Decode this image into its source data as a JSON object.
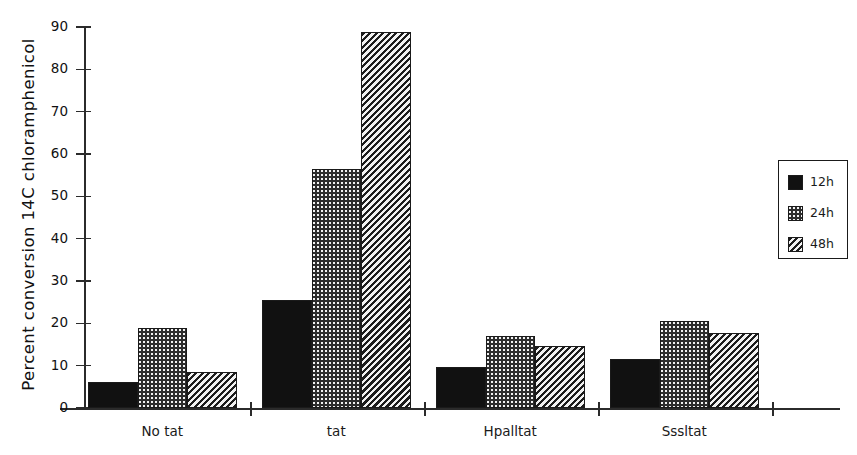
{
  "chart_data": {
    "type": "bar",
    "title": "",
    "xlabel": "",
    "ylabel": "Percent conversion 14C chloramphenicol",
    "ylim": [
      0,
      90
    ],
    "yticks": [
      0,
      10,
      20,
      30,
      40,
      50,
      60,
      70,
      80,
      90
    ],
    "grid": false,
    "legend_position": "right",
    "categories": [
      "No tat",
      "tat",
      "Hpalltat",
      "Sssltat"
    ],
    "series": [
      {
        "name": "12h",
        "pattern": "solid",
        "color": "#111111",
        "values": [
          6.2,
          25.5,
          9.7,
          11.5
        ]
      },
      {
        "name": "24h",
        "pattern": "dots",
        "color": "#2d2d2d",
        "values": [
          18.8,
          56.5,
          17.1,
          20.6
        ]
      },
      {
        "name": "48h",
        "pattern": "diagonal",
        "color": "#1c1c1c",
        "values": [
          8.6,
          88.8,
          14.6,
          17.8
        ]
      }
    ]
  },
  "axis": {
    "y_title": "Percent conversion 14C chloramphenicol",
    "y_tick_labels": [
      "90",
      "80",
      "70",
      "60",
      "50",
      "40",
      "30",
      "20",
      "10",
      "0"
    ],
    "x_tick_labels": [
      "No tat",
      "tat",
      "Hpalltat",
      "Sssltat"
    ]
  },
  "legend": {
    "entries": [
      {
        "label": "12h",
        "swatch": "solid-swatch-icon"
      },
      {
        "label": "24h",
        "swatch": "dotted-swatch-icon"
      },
      {
        "label": "48h",
        "swatch": "diagonal-swatch-icon"
      }
    ]
  }
}
